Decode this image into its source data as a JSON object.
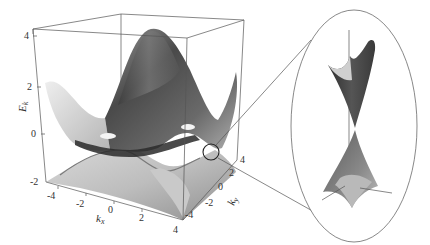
{
  "figure": {
    "z_axis": {
      "label": "E",
      "label_sub": "k",
      "ticks": [
        "4",
        "2",
        "0",
        "-2"
      ]
    },
    "x_axis": {
      "label": "k",
      "label_sub": "x",
      "ticks": [
        "-4",
        "-2",
        "0",
        "2",
        "4"
      ]
    },
    "y_axis": {
      "label": "k",
      "label_sub": "y",
      "ticks": [
        "-4",
        "-2",
        "0",
        "2",
        "4"
      ]
    },
    "highlight": {
      "shape": "circle",
      "meaning": "Dirac point (band touching)"
    },
    "inset": {
      "shape": "ellipse",
      "content": "magnified Dirac cones: upper cone (conduction band) and lower cone (valence band) touching at a point"
    },
    "colors": {
      "surface_dark": "#3a3a3a",
      "surface_mid": "#8a8a8a",
      "surface_light": "#e6e6e6",
      "box_lines": "#555555"
    }
  }
}
